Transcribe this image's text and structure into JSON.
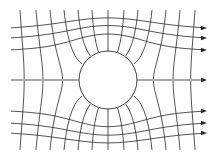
{
  "diagram": {
    "type": "flow-field-around-cylinder",
    "colors": {
      "background": "#ffffff",
      "line": "#2a2a2a"
    },
    "circle": {
      "cx": 108,
      "cy": 80,
      "r": 29
    },
    "streamlines_y": [
      28,
      38,
      50,
      80,
      111,
      123,
      133
    ],
    "equipotential_x": [
      20,
      36,
      50,
      64,
      78,
      92,
      108,
      124,
      138,
      152,
      166,
      180,
      195
    ],
    "x_start": 11,
    "x_end": 207,
    "y_top": 10,
    "y_bottom": 150,
    "arrow_count": 7
  }
}
